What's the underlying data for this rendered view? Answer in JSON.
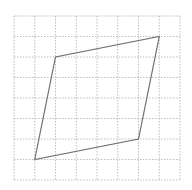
{
  "diagram": {
    "type": "parallelogram-on-grid",
    "grid": {
      "columns": 8,
      "rows": 8,
      "x0": 14,
      "y0": 16,
      "x1": 180,
      "y1": 180,
      "line_color": "#bdbdbd",
      "dash": "1.5,1.5"
    },
    "shape": {
      "name": "parallelogram",
      "stroke": "#707070",
      "vertices_grid": [
        [
          1,
          7
        ],
        [
          2,
          2
        ],
        [
          7,
          1
        ],
        [
          6,
          6
        ]
      ],
      "vertices_px": [
        [
          35,
          159
        ],
        [
          55,
          57
        ],
        [
          159,
          37
        ],
        [
          138,
          139
        ]
      ]
    }
  }
}
